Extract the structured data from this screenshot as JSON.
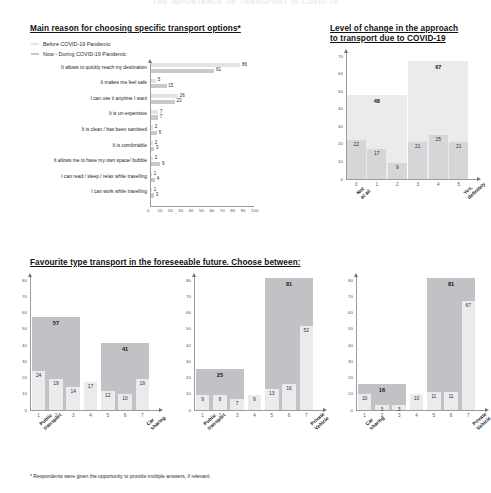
{
  "banner_title": "THE IMPORTANCE OF TRANSPORT IN COVID-19",
  "footnote": "* Respondents were given the opportunity to provide multiple answers, if relevant.",
  "colors": {
    "before": "#e3e3e5",
    "now": "#c9c9cc",
    "light": "#ebebed",
    "mid": "#d6d6d9",
    "dark": "#c2c2c6",
    "axis": "#9a9aa0"
  },
  "reasons": {
    "title": "Main reason for choosing specific transport options*",
    "legend": [
      {
        "label": "Before COVID-19 Pandemic",
        "color": "#e3e3e5"
      },
      {
        "label": "Now - During COVID-19 Pandemic",
        "color": "#c9c9cc"
      }
    ],
    "xticks": [
      "0",
      "10",
      "20",
      "30",
      "40",
      "50",
      "60",
      "70",
      "80",
      "90",
      "100"
    ],
    "chart_data": {
      "type": "bar",
      "orientation": "horizontal",
      "title": "Main reason for choosing specific transport options*",
      "categories": [
        "It allows to quickly reach my destination",
        "It makes me feel safe",
        "I can use it anytime I want",
        "It is un-expensive",
        "It is clean / has been sanitised",
        "It is comfortable",
        "It allows me to have my own space/ bubble",
        "I can read / sleep / relax while travelling",
        "I can work while travelling"
      ],
      "series": [
        {
          "name": "Before COVID-19 Pandemic",
          "values": [
            86,
            5,
            26,
            7,
            2,
            2,
            2,
            1,
            1
          ]
        },
        {
          "name": "Now - During COVID-19 Pandemic",
          "values": [
            61,
            15,
            23,
            7,
            6,
            3,
            9,
            4,
            3
          ]
        }
      ],
      "xlabel": "",
      "ylabel": "",
      "xlim": [
        0,
        100
      ],
      "grid": false,
      "legend_position": "top-left"
    }
  },
  "level_change": {
    "title_line1": "Level of change in the approach",
    "title_line2": "to transport due to COVID-19",
    "yticks": [
      "0",
      "10",
      "20",
      "30",
      "40",
      "50",
      "60",
      "70"
    ],
    "xticks": [
      "0",
      "1",
      "2",
      "3",
      "4",
      "5"
    ],
    "left_label_l1": "Not",
    "left_label_l2": "at all",
    "right_label_l1": "Yes,",
    "right_label_l2": "definitely",
    "chart_data": {
      "type": "bar",
      "title": "Level of change in the approach to transport due to COVID-19",
      "categories": [
        "0",
        "1",
        "2",
        "3",
        "4",
        "5"
      ],
      "values": [
        22,
        17,
        9,
        21,
        25,
        21
      ],
      "group_totals": [
        {
          "label": "48",
          "value": 48,
          "covers": [
            "0",
            "1",
            "2"
          ]
        },
        {
          "label": "67",
          "value": 67,
          "covers": [
            "3",
            "4",
            "5"
          ]
        }
      ],
      "xlabel": "",
      "ylabel": "",
      "ylim": [
        0,
        70
      ],
      "grid": false
    }
  },
  "favourite": {
    "title": "Favourite type transport in the foreseeable future. Choose between:",
    "charts": [
      {
        "yticks": [
          "0",
          "10",
          "20",
          "30",
          "40",
          "50",
          "60",
          "70",
          "80"
        ],
        "xticks": [
          "1",
          "2",
          "3",
          "4",
          "5",
          "6",
          "7"
        ],
        "left_label_l1": "Public",
        "left_label_l2": "transport",
        "right_label_l1": "Car",
        "right_label_l2": "sharing",
        "chart_data": {
          "type": "bar",
          "title": "Public transport vs Car sharing",
          "categories": [
            "1",
            "2",
            "3",
            "4",
            "5",
            "6",
            "7"
          ],
          "values": [
            24,
            19,
            14,
            17,
            12,
            10,
            19
          ],
          "group_totals": [
            {
              "label": "57",
              "value": 57,
              "covers": [
                "1",
                "2",
                "3"
              ]
            },
            {
              "label": "41",
              "value": 41,
              "covers": [
                "5",
                "6",
                "7"
              ]
            }
          ],
          "ylim": [
            0,
            80
          ],
          "grid": false
        }
      },
      {
        "yticks": [
          "0",
          "10",
          "20",
          "30",
          "40",
          "50",
          "60",
          "70",
          "80"
        ],
        "xticks": [
          "1",
          "2",
          "3",
          "4",
          "5",
          "6",
          "7"
        ],
        "left_label_l1": "Public",
        "left_label_l2": "transport",
        "right_label_l1": "Private",
        "right_label_l2": "Vehicle",
        "chart_data": {
          "type": "bar",
          "title": "Public transport vs Private Vehicle",
          "categories": [
            "1",
            "2",
            "3",
            "4",
            "5",
            "6",
            "7"
          ],
          "values": [
            9,
            9,
            7,
            9,
            13,
            16,
            52
          ],
          "group_totals": [
            {
              "label": "25",
              "value": 25,
              "covers": [
                "1",
                "2",
                "3"
              ]
            },
            {
              "label": "81",
              "value": 81,
              "covers": [
                "5",
                "6",
                "7"
              ]
            }
          ],
          "ylim": [
            0,
            80
          ],
          "grid": false
        }
      },
      {
        "yticks": [
          "0",
          "10",
          "20",
          "30",
          "40",
          "50",
          "60",
          "70",
          "80"
        ],
        "xticks": [
          "1",
          "2",
          "3",
          "4",
          "5",
          "6",
          "7"
        ],
        "left_label_l1": "Car",
        "left_label_l2": "sharing",
        "right_label_l1": "Private",
        "right_label_l2": "Vehicle",
        "chart_data": {
          "type": "bar",
          "title": "Car sharing vs Private Vehicle",
          "categories": [
            "1",
            "2",
            "3",
            "4",
            "5",
            "6",
            "7"
          ],
          "values": [
            10,
            3,
            3,
            10,
            11,
            11,
            67
          ],
          "group_totals": [
            {
              "label": "16",
              "value": 16,
              "covers": [
                "1",
                "2",
                "3"
              ]
            },
            {
              "label": "81",
              "value": 81,
              "covers": [
                "5",
                "6",
                "7"
              ]
            }
          ],
          "ylim": [
            0,
            80
          ],
          "grid": false
        }
      }
    ]
  }
}
